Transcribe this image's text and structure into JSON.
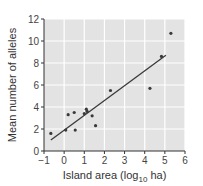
{
  "chart_data": {
    "type": "scatter",
    "title": "",
    "xlabel": "Island area (log10 ha)",
    "xlabel_parts": {
      "pre": "Island area (log",
      "sub": "10",
      "post": " ha)"
    },
    "ylabel": "Mean number of alleles",
    "xlim": [
      -1,
      6
    ],
    "ylim": [
      0,
      12
    ],
    "x_ticks": [
      -1,
      0,
      1,
      2,
      3,
      4,
      5,
      6
    ],
    "x_tick_labels": [
      "−1",
      "0",
      "1",
      "2",
      "3",
      "4",
      "5",
      "6"
    ],
    "y_ticks": [
      0,
      2,
      4,
      6,
      8,
      10,
      12
    ],
    "y_tick_labels": [
      "0",
      "2",
      "4",
      "6",
      "8",
      "10",
      "12"
    ],
    "grid": true,
    "legend": null,
    "series": [
      {
        "name": "Islands",
        "points": [
          {
            "x": -0.66,
            "y": 1.6
          },
          {
            "x": 0.08,
            "y": 1.9
          },
          {
            "x": 0.2,
            "y": 3.3
          },
          {
            "x": 0.5,
            "y": 3.5
          },
          {
            "x": 0.55,
            "y": 1.9
          },
          {
            "x": 1.0,
            "y": 3.4
          },
          {
            "x": 1.1,
            "y": 3.8
          },
          {
            "x": 1.14,
            "y": 3.6
          },
          {
            "x": 1.39,
            "y": 3.2
          },
          {
            "x": 1.56,
            "y": 2.3
          },
          {
            "x": 2.3,
            "y": 5.5
          },
          {
            "x": 4.26,
            "y": 5.7
          },
          {
            "x": 4.83,
            "y": 8.6
          },
          {
            "x": 5.3,
            "y": 10.7
          }
        ]
      }
    ],
    "trendline": {
      "type": "linear",
      "x0": -0.66,
      "y0": 1.0,
      "x1": 5.05,
      "y1": 8.7
    },
    "colors": {
      "plot_bg": "#e3e3e3",
      "grid": "#ffffff",
      "points": "#3a3a3a",
      "line": "#3a3a3a",
      "axis": "#333333"
    }
  }
}
